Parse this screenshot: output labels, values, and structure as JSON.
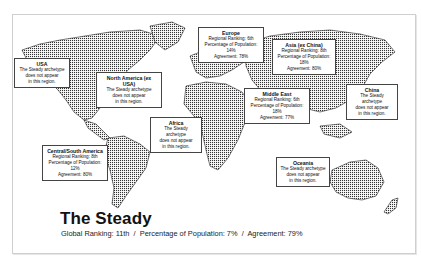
{
  "archetype": {
    "title": "The Steady",
    "global_ranking_label": "Global Ranking: 11th",
    "population_label": "Percentage of Population: 7%",
    "agreement_label": "Agreement: 79%",
    "separator": "/"
  },
  "regions": {
    "usa": {
      "name": "USA",
      "lines": [
        "The Steady archetype",
        "does not appear",
        "in this region."
      ]
    },
    "north_america": {
      "name": "North America (ex USA)",
      "lines": [
        "The Steady archetype",
        "does not appear",
        "in this region."
      ]
    },
    "europe": {
      "name": "Europe",
      "lines": [
        "Regional Ranking: 6th",
        "Percentage of Population: 14%",
        "Agreement: 78%"
      ]
    },
    "asia": {
      "name": "Asia (ex China)",
      "lines": [
        "Regional Ranking: 8th",
        "Percentage of Population: 18%",
        "Agreement: 80%"
      ]
    },
    "middle_east": {
      "name": "Middle East",
      "lines": [
        "Regional Ranking: 6th",
        "Percentage of Population: 18%",
        "Agreement: 77%"
      ]
    },
    "china": {
      "name": "China",
      "lines": [
        "The Steady archetype",
        "does not appear",
        "in this region."
      ]
    },
    "africa": {
      "name": "Africa",
      "lines": [
        "The Steady archetype",
        "does not appear",
        "in this region."
      ]
    },
    "central_south_america": {
      "name": "Central/South America",
      "lines": [
        "Regional Ranking: 8th",
        "Percentage of Population: 12%",
        "Agreement: 80%"
      ]
    },
    "oceania": {
      "name": "Oceania",
      "lines": [
        "The Steady archetype",
        "does not appear",
        "in this region."
      ]
    }
  }
}
